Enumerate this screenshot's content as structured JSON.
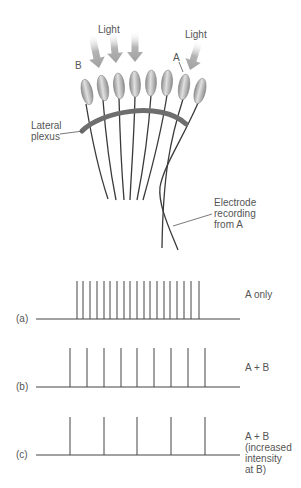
{
  "diagram": {
    "labels": {
      "light_left": "Light",
      "light_right": "Light",
      "receptor_b": "B",
      "receptor_a": "A",
      "lateral_plexus": [
        "Lateral",
        "plexus"
      ],
      "electrode": [
        "Electrode",
        "recording",
        "from A"
      ]
    },
    "colors": {
      "arrow": "#a8a8a8",
      "ommatidium_light": "#d6d6d6",
      "ommatidium_dark": "#8c8c8c",
      "plexus": "#6e6e6e",
      "fiber": "#3a3a3a",
      "text": "#555555",
      "trace": "#444444"
    },
    "ommatidia": [
      {
        "cx": 87,
        "cy": 92,
        "rot": -12
      },
      {
        "cx": 103,
        "cy": 88,
        "rot": -9
      },
      {
        "cx": 119,
        "cy": 86,
        "rot": -5
      },
      {
        "cx": 135,
        "cy": 84,
        "rot": -2
      },
      {
        "cx": 151,
        "cy": 83,
        "rot": 2
      },
      {
        "cx": 167,
        "cy": 83,
        "rot": 5
      },
      {
        "cx": 184,
        "cy": 87,
        "rot": 9
      },
      {
        "cx": 200,
        "cy": 91,
        "rot": 13
      }
    ],
    "fibers": [
      {
        "d": "M86 104 C 92 140, 100 175, 108 199"
      },
      {
        "d": "M103 100 C 106 140, 111 175, 116 200"
      },
      {
        "d": "M119 98 C 120 140, 122 175, 124 200"
      },
      {
        "d": "M135 96 C 134 140, 131 175, 130 200"
      },
      {
        "d": "M151 95 C 148 140, 142 175, 137 200"
      },
      {
        "d": "M167 95 C 160 140, 150 175, 143 200"
      },
      {
        "d": "M183 99 C 170 140, 163 175, 162 248"
      },
      {
        "d": "M198 103 C 182 140, 164 165, 160 187 C 158 205, 170 230, 178 250"
      }
    ],
    "arrows": [
      {
        "x1": 92,
        "y1": 35,
        "x2": 99,
        "y2": 68
      },
      {
        "x1": 113,
        "y1": 33,
        "x2": 116,
        "y2": 63
      },
      {
        "x1": 135,
        "y1": 32,
        "x2": 135,
        "y2": 62
      },
      {
        "x1": 199,
        "y1": 42,
        "x2": 190,
        "y2": 70
      }
    ]
  },
  "recordings": [
    {
      "panel": "(a)",
      "condition": [
        "A only"
      ],
      "baseline_y": 319,
      "spike_top_y": 281,
      "spikes_x": [
        77,
        83,
        90,
        97,
        104,
        110,
        117,
        124,
        130,
        137,
        144,
        150,
        157,
        164,
        170,
        177,
        184,
        191,
        199
      ]
    },
    {
      "panel": "(b)",
      "condition": [
        "A + B"
      ],
      "baseline_y": 387,
      "spike_top_y": 348,
      "spikes_x": [
        70,
        87,
        104,
        121,
        137,
        154,
        171,
        188,
        205
      ]
    },
    {
      "panel": "(c)",
      "condition": [
        "A + B",
        "(increased",
        "intensity",
        "at B)"
      ],
      "baseline_y": 455,
      "spike_top_y": 417,
      "spikes_x": [
        70,
        104,
        137,
        171,
        205
      ]
    }
  ],
  "chart_data": {
    "type": "line",
    "title": "",
    "xlabel": "time",
    "ylabel": "",
    "series": [
      {
        "name": "(a) A only",
        "spike_count": 19
      },
      {
        "name": "(b) A + B",
        "spike_count": 9
      },
      {
        "name": "(c) A + B (increased intensity at B)",
        "spike_count": 5
      }
    ]
  }
}
